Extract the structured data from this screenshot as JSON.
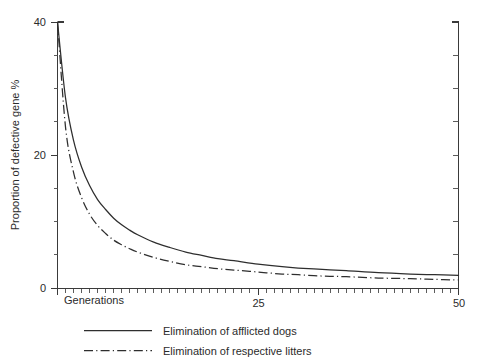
{
  "chart_data": {
    "type": "line",
    "title": "",
    "xlabel": "Generations",
    "ylabel": "Proportion of defective gene %",
    "xlim": [
      0,
      50
    ],
    "ylim": [
      0,
      40
    ],
    "grid": false,
    "legend_position": "bottom",
    "x_ticks_major": [
      0,
      25,
      50
    ],
    "x_tick_labels": [
      "",
      "25",
      "50"
    ],
    "x_minor_tick_step": 1,
    "y_ticks_major": [
      0,
      20,
      40
    ],
    "y_tick_labels": [
      "0",
      "20",
      "40"
    ],
    "y_minor_tick_step": 5,
    "right_axis_tick_step": 5,
    "x": [
      0,
      1,
      2,
      3,
      4,
      5,
      6,
      7,
      8,
      9,
      10,
      12,
      14,
      16,
      18,
      20,
      22,
      25,
      28,
      30,
      33,
      36,
      40,
      44,
      47,
      50
    ],
    "series": [
      {
        "name": "Elimination of afflicted dogs",
        "style": "solid",
        "values": [
          40.0,
          28.6,
          22.2,
          18.2,
          15.4,
          13.3,
          11.8,
          10.5,
          9.5,
          8.7,
          8.0,
          6.9,
          6.1,
          5.4,
          4.9,
          4.4,
          4.1,
          3.6,
          3.2,
          3.0,
          2.8,
          2.6,
          2.3,
          2.1,
          2.0,
          1.9
        ]
      },
      {
        "name": "Elimination of respective litters",
        "style": "dash-dot",
        "values": [
          40.0,
          24.2,
          17.4,
          13.6,
          11.1,
          9.4,
          8.2,
          7.2,
          6.5,
          5.9,
          5.4,
          4.6,
          4.0,
          3.5,
          3.2,
          2.9,
          2.7,
          2.4,
          2.1,
          2.0,
          1.8,
          1.7,
          1.5,
          1.4,
          1.3,
          1.2
        ]
      }
    ]
  },
  "axes": {
    "y_title": "Proportion of defective gene %",
    "x_title": "Generations",
    "y_labels": {
      "top": "40",
      "mid": "20",
      "bottom": "0"
    },
    "x_labels": {
      "mid": "25",
      "right": "50"
    }
  },
  "legend": {
    "entries": [
      {
        "label": "Elimination of afflicted dogs",
        "style": "solid"
      },
      {
        "label": "Elimination of respective litters",
        "style": "dash-dot"
      }
    ]
  }
}
